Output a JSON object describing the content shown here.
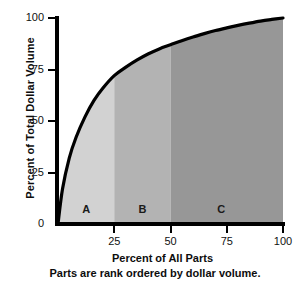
{
  "chart_data": {
    "type": "area",
    "title": "",
    "xlabel": "Percent of All Parts",
    "ylabel": "Percent of Total Dollar Volume",
    "note": "Parts are rank ordered by dollar volume.",
    "xlim": [
      0,
      100
    ],
    "ylim": [
      0,
      100
    ],
    "grid": false,
    "legend": "none",
    "x_ticks": [
      "25",
      "50",
      "75",
      "100"
    ],
    "x_tick_values": [
      25,
      50,
      75,
      100
    ],
    "y_ticks": [
      "0",
      "25",
      "50",
      "75",
      "100"
    ],
    "y_tick_values": [
      0,
      25,
      50,
      75,
      100
    ],
    "series": [
      {
        "name": "Cumulative percent of total dollar volume",
        "x": [
          0,
          2,
          5,
          8,
          12,
          16,
          20,
          25,
          30,
          35,
          40,
          45,
          50,
          55,
          60,
          65,
          70,
          75,
          80,
          85,
          90,
          95,
          100
        ],
        "values": [
          0,
          17,
          32,
          42,
          52,
          60,
          66,
          72,
          76,
          79.5,
          82.5,
          85,
          87,
          89,
          90.8,
          92.4,
          93.9,
          95.2,
          96.4,
          97.5,
          98.5,
          99.3,
          100
        ]
      }
    ],
    "regions": [
      {
        "label": "A",
        "x_start": 0,
        "x_end": 25,
        "color": "#d2d2d2",
        "label_x": 12.5,
        "label_y": 7
      },
      {
        "label": "B",
        "x_start": 25,
        "x_end": 50,
        "color": "#b3b3b3",
        "label_x": 37.5,
        "label_y": 7
      },
      {
        "label": "C",
        "x_start": 50,
        "x_end": 100,
        "color": "#979797",
        "label_x": 72.5,
        "label_y": 7
      }
    ],
    "curve_color": "#000000",
    "axis_color": "#000000",
    "background_color": "#ffffff"
  }
}
